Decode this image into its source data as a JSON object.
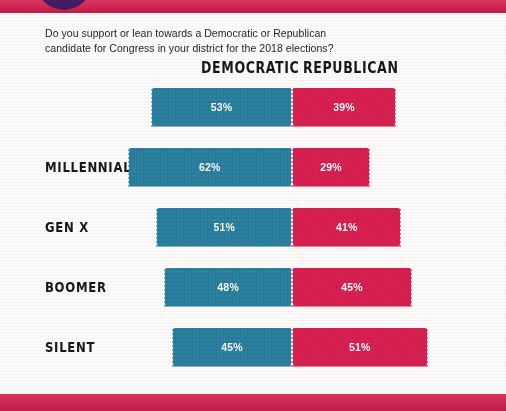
{
  "banner": {
    "top_color": "#d81f4f",
    "bottom_color": "#d81f4f",
    "logo_icon": "circle-logo-icon"
  },
  "question": "Do you support or lean towards a Democratic or Republican candidate for Congress in your district for the 2018 elections?",
  "columns": {
    "democratic": "DEMOCRATIC",
    "republican": "REPUBLICAN"
  },
  "colors": {
    "democratic": "#2a7e9e",
    "republican": "#d81f4f",
    "text": "#16181b"
  },
  "chart_data": {
    "type": "bar",
    "title": "Do you support or lean towards a Democratic or Republican candidate for Congress in your district for the 2018 elections?",
    "xlabel": "",
    "ylabel": "",
    "orientation": "horizontal-diverging",
    "grid": false,
    "legend_position": "top",
    "categories": [
      "",
      "MILLENNIAL",
      "GEN X",
      "BOOMER",
      "SILENT"
    ],
    "series": [
      {
        "name": "DEMOCRATIC",
        "color": "#2a7e9e",
        "values": [
          53,
          62,
          51,
          48,
          45
        ]
      },
      {
        "name": "REPUBLICAN",
        "color": "#d81f4f",
        "values": [
          39,
          29,
          41,
          45,
          51
        ]
      }
    ],
    "value_suffix": "%",
    "rows": [
      {
        "label": "",
        "democratic": "53%",
        "republican": "39%",
        "dem_value": 53,
        "rep_value": 39
      },
      {
        "label": "MILLENNIAL",
        "democratic": "62%",
        "republican": "29%",
        "dem_value": 62,
        "rep_value": 29
      },
      {
        "label": "GEN X",
        "democratic": "51%",
        "republican": "41%",
        "dem_value": 51,
        "rep_value": 41
      },
      {
        "label": "BOOMER",
        "democratic": "48%",
        "republican": "45%",
        "dem_value": 48,
        "rep_value": 45
      },
      {
        "label": "SILENT",
        "democratic": "45%",
        "republican": "51%",
        "dem_value": 45,
        "rep_value": 51
      }
    ]
  }
}
